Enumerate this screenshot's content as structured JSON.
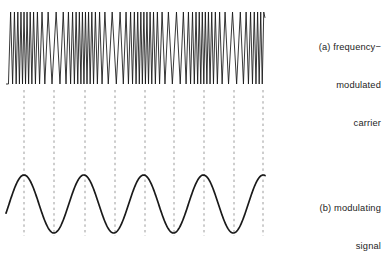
{
  "figure": {
    "background_color": "#ffffff",
    "ink_color": "#1a1a1a",
    "dash_color": "#8c8c8c",
    "panels": [
      {
        "id": "a",
        "name": "frequency-modulated-carrier",
        "caption_lines": [
          "(a) frequency−",
          "modulated",
          "carrier"
        ],
        "plot_area": {
          "x": 6,
          "y": 10,
          "width": 259,
          "height": 76
        }
      },
      {
        "id": "b",
        "name": "modulating-signal",
        "caption_lines": [
          "(b) modulating",
          "signal"
        ],
        "plot_area": {
          "x": 6,
          "y": 172,
          "width": 259,
          "height": 64
        }
      }
    ],
    "guide_lines": {
      "name": "alignment-dashed-guides",
      "count": 9,
      "x_positions": [
        24,
        54,
        85,
        115,
        145,
        174,
        204,
        234,
        263
      ],
      "y_top": 90,
      "y_bottom": 236,
      "dash": "2.4 3.2",
      "color": "#909090",
      "width": 0.9
    }
  },
  "chart_data": {
    "type": "line",
    "title": "",
    "xlabel": "",
    "ylabel": "",
    "grid": false,
    "legend_position": "right",
    "series": [
      {
        "name": "frequency-modulated carrier",
        "panel": "a",
        "waveform": "fm",
        "carrier_center_frequency_cycles_per_px": 0.225,
        "frequency_deviation_cycles_per_px": 0.105,
        "amplitude_px": 36,
        "baseline_y": 48,
        "x_start": 6,
        "x_end": 265,
        "modulation_period_px": 59.8,
        "modulation_phase_peak_x": 24,
        "dense_region_centers_x": [
          24,
          85,
          145,
          204,
          263
        ],
        "sparse_region_centers_x": [
          54,
          115,
          174,
          234
        ],
        "description": "Carrier packed densest (highest instantaneous frequency) beneath modulating-signal peaks and sparsest beneath its troughs."
      },
      {
        "name": "modulating signal",
        "panel": "b",
        "waveform": "sine",
        "amplitude_px": 29,
        "baseline_y": 204,
        "peak_y": 175,
        "trough_y": 233,
        "period_px": 59.8,
        "x_start": 6,
        "x_end": 265,
        "peaks_x": [
          24,
          85,
          145,
          204,
          263
        ],
        "troughs_x": [
          54,
          115,
          174,
          234
        ],
        "cycles_visible": 4.3
      }
    ]
  }
}
